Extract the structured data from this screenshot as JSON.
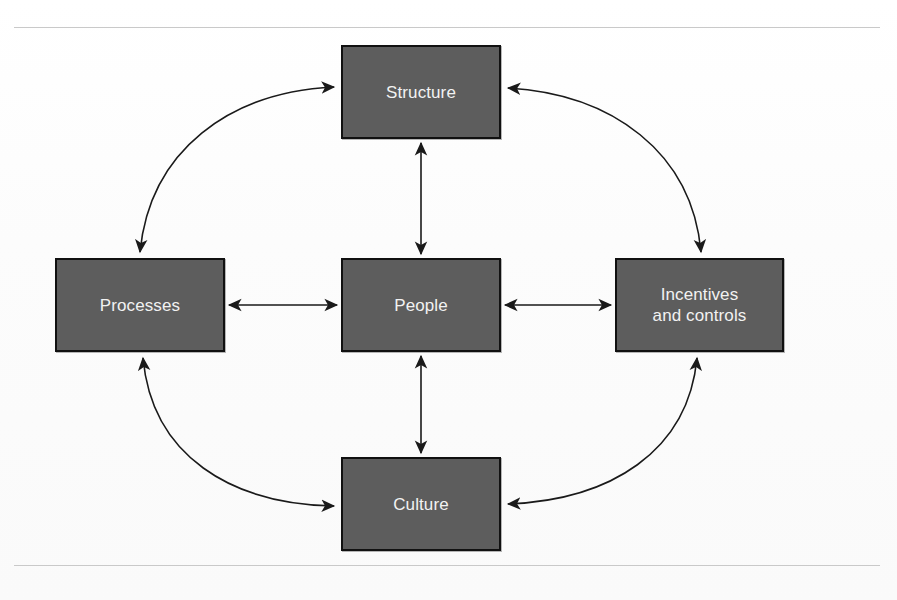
{
  "diagram": {
    "type": "cycle-network",
    "title_visible": false,
    "box_fill_color": "#5d5d5d",
    "box_border_color": "#111111",
    "label_color": "#f2f2f2",
    "connector_color": "#1a1a1a",
    "page_background": "#fdfdfd",
    "rule_color": "#c9c9c9",
    "nodes": [
      {
        "id": "structure",
        "label": "Structure",
        "position": "top"
      },
      {
        "id": "processes",
        "label": "Processes",
        "position": "left"
      },
      {
        "id": "people",
        "label": "People",
        "position": "center"
      },
      {
        "id": "incentives",
        "label": "Incentives\nand controls",
        "position": "right"
      },
      {
        "id": "culture",
        "label": "Culture",
        "position": "bottom"
      }
    ],
    "connectors": [
      {
        "from": "people",
        "to": "structure",
        "style": "straight",
        "arrows": "both"
      },
      {
        "from": "people",
        "to": "processes",
        "style": "straight",
        "arrows": "both"
      },
      {
        "from": "people",
        "to": "incentives",
        "style": "straight",
        "arrows": "both"
      },
      {
        "from": "people",
        "to": "culture",
        "style": "straight",
        "arrows": "both"
      },
      {
        "from": "processes",
        "to": "structure",
        "style": "curved",
        "arrows": "both"
      },
      {
        "from": "structure",
        "to": "incentives",
        "style": "curved",
        "arrows": "both"
      },
      {
        "from": "processes",
        "to": "culture",
        "style": "curved",
        "arrows": "both"
      },
      {
        "from": "culture",
        "to": "incentives",
        "style": "curved",
        "arrows": "both"
      }
    ]
  }
}
